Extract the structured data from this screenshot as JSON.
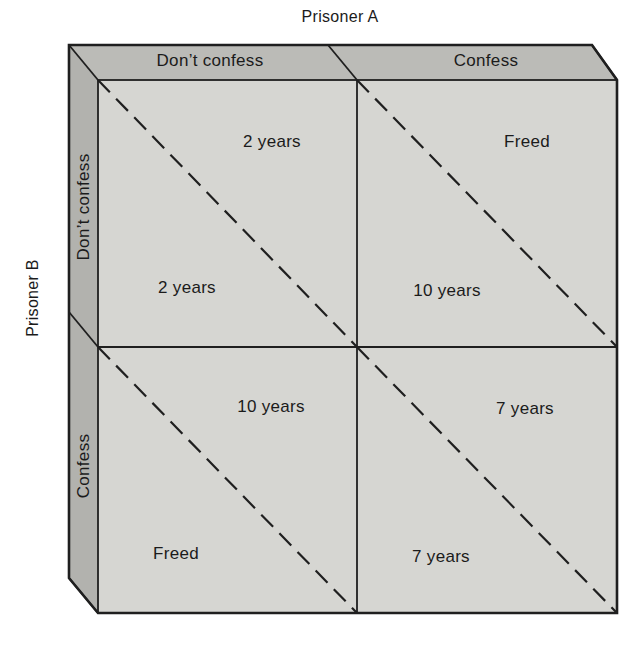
{
  "figure": {
    "player_a_label": "Prisoner A",
    "player_b_label": "Prisoner B"
  },
  "columns": [
    {
      "label": "Don’t confess"
    },
    {
      "label": "Confess"
    }
  ],
  "rows": [
    {
      "label": "Don’t confess"
    },
    {
      "label": "Confess"
    }
  ],
  "cells": {
    "top_left": {
      "upper": "2 years",
      "lower": "2 years"
    },
    "top_right": {
      "upper": "Freed",
      "lower": "10 years"
    },
    "bottom_left": {
      "upper": "10 years",
      "lower": "Freed"
    },
    "bottom_right": {
      "upper": "7 years",
      "lower": "7 years"
    }
  },
  "colors": {
    "top_face": "#bbbbb7",
    "left_face": "#b2b2ae",
    "cell_fill": "#d6d6d2",
    "line": "#1f1f1f",
    "text": "#1b1b1b",
    "background": "#ffffff"
  }
}
